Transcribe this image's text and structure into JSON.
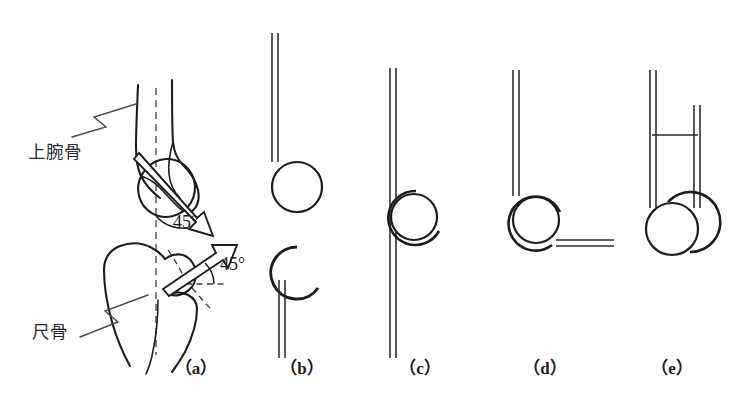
{
  "figure": {
    "background_color": "#ffffff",
    "ink_color": "#1d1d1d",
    "dash_color": "#5a5a5a",
    "width": 731,
    "height": 410
  },
  "anatomy_labels": [
    {
      "id": "humerus",
      "text": "上腕骨",
      "romaji_meaning": "humerus",
      "x": 28,
      "y": 158
    },
    {
      "id": "ulna",
      "text": "尺骨",
      "romaji_meaning": "ulna",
      "x": 32,
      "y": 338
    }
  ],
  "angle_annotations": [
    {
      "id": "humerus-angle",
      "text": "45°",
      "value": 45,
      "unit": "degrees",
      "x": 173,
      "y": 228
    },
    {
      "id": "ulna-angle",
      "text": "45°",
      "value": 45,
      "unit": "degrees",
      "x": 220,
      "y": 270
    }
  ],
  "panels": [
    {
      "key": "a",
      "label": "（a）",
      "label_x": 196,
      "label_y": 374,
      "description": "anatomical drawing of humerus and ulna with 45 degree axes"
    },
    {
      "key": "b",
      "label": "（b）",
      "label_x": 302,
      "label_y": 374,
      "description": "schematic separated: shaft with circular head above, C-shaped notch below"
    },
    {
      "key": "c",
      "label": "（c）",
      "label_x": 420,
      "label_y": 374,
      "description": "schematic articulated in full extension, shaft continuous through joint"
    },
    {
      "key": "d",
      "label": "（d）",
      "label_x": 545,
      "label_y": 374,
      "description": "schematic flexed to 90 degrees"
    },
    {
      "key": "e",
      "label": "（e）",
      "label_x": 672,
      "label_y": 374,
      "description": "schematic in full flexion, both shafts parallel vertical"
    }
  ]
}
